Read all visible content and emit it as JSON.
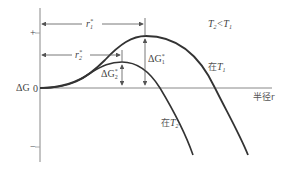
{
  "diagram": {
    "type": "free-energy-vs-radius",
    "y_axis": {
      "label": "ΔG",
      "origin_label": "0",
      "plus_label": "+",
      "minus_label": "−"
    },
    "x_axis": {
      "label": "半径r"
    },
    "condition": "T₂<T₁",
    "curves": [
      {
        "name": "在T₁",
        "color": "#333333"
      },
      {
        "name": "在T₂",
        "color": "#333333"
      }
    ],
    "annotations": {
      "r1": "r₁*",
      "r2": "r₂*",
      "dG1": "ΔG₁*",
      "dG2": "ΔG₂*"
    }
  },
  "labels": {
    "dG": "ΔG",
    "zero": "0",
    "plus": "+",
    "minus": "−",
    "x_axis": "半径r",
    "cond": "T",
    "cond_sub2": "2",
    "cond_lt": "<",
    "cond_sub1": "1",
    "at": "在",
    "T": "T",
    "sub1": "1",
    "sub2": "2",
    "r": "r",
    "star": "*",
    "delta_g": "ΔG"
  }
}
